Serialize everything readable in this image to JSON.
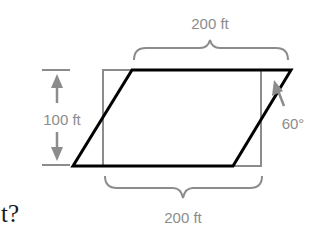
{
  "diagram": {
    "top_width_label": "200 ft",
    "bottom_width_label": "200 ft",
    "height_label": "100 ft",
    "angle_label": "60°",
    "question_fragment": "t?",
    "shapes": {
      "rectangle": {
        "x": 103,
        "y": 70,
        "width": 158,
        "height": 96
      },
      "parallelogram": {
        "points": [
          [
            132,
            70
          ],
          [
            291,
            70
          ],
          [
            233,
            166
          ],
          [
            73,
            166
          ]
        ]
      }
    },
    "colors": {
      "parallelogram_stroke": "#000000",
      "rectangle_stroke": "#8c8c8c",
      "annotation": "#8c8c8c",
      "text": "#1a1a1a"
    }
  }
}
